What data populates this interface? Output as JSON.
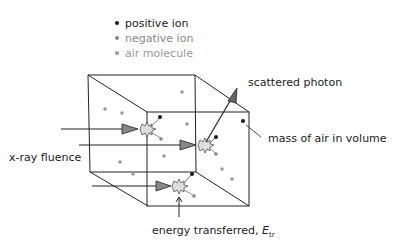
{
  "legend": {
    "items": [
      {
        "label": "positive ion",
        "color": "#1a1a1a"
      },
      {
        "label": "negative ion",
        "color": "#8a8a8a"
      },
      {
        "label": "air molecule",
        "color": "#9a9a9a"
      }
    ]
  },
  "labels": {
    "scattered_photon": "scattered photon",
    "mass_of_air": "mass of air in volume",
    "xray_fluence": "x-ray fluence",
    "energy_transferred": "energy transferred, ",
    "energy_symbol": "E",
    "energy_subscript": "tr"
  },
  "colors": {
    "line": "#222222",
    "arrowhead": "#777777",
    "burst_fill": "#dddddd",
    "positive_ion": "#1a1a1a",
    "negative_ion": "#888888",
    "air_molecule": "#999999"
  }
}
